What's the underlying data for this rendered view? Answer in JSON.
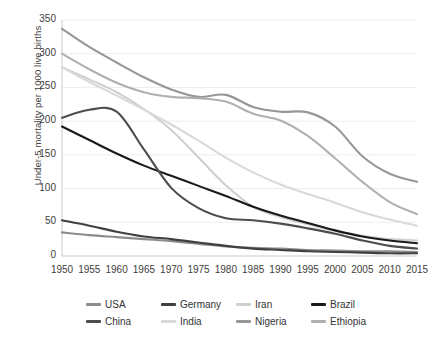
{
  "chart_data": {
    "type": "line",
    "title": "",
    "xlabel": "",
    "ylabel": "Under-5 mortality per 1000 live births",
    "x": [
      1950,
      1955,
      1960,
      1965,
      1970,
      1975,
      1980,
      1985,
      1990,
      1995,
      2000,
      2005,
      2010,
      2015
    ],
    "xlim": [
      1950,
      2015
    ],
    "ylim": [
      0,
      350
    ],
    "yticks": [
      0,
      50,
      100,
      150,
      200,
      250,
      300,
      350
    ],
    "xticks": [
      "1950",
      "1955",
      "1960",
      "1965",
      "1970",
      "1975",
      "1980",
      "1985",
      "1990",
      "1995",
      "2000",
      "2005",
      "2010",
      "2015"
    ],
    "grid": "horizontal",
    "legend_position": "bottom",
    "series": [
      {
        "name": "USA",
        "color": "#8c8c8c",
        "values": [
          35,
          31,
          28,
          25,
          22,
          18,
          14,
          12,
          11,
          9,
          8,
          7,
          7,
          6
        ]
      },
      {
        "name": "Germany",
        "color": "#404040",
        "values": [
          53,
          45,
          36,
          29,
          25,
          20,
          15,
          11,
          9,
          7,
          6,
          5,
          4,
          4
        ]
      },
      {
        "name": "Iran",
        "color": "#cfcfcf",
        "values": [
          280,
          262,
          243,
          218,
          187,
          146,
          105,
          73,
          58,
          47,
          37,
          30,
          25,
          23
        ]
      },
      {
        "name": "Brazil",
        "color": "#1a1a1a",
        "values": [
          192,
          172,
          152,
          134,
          119,
          104,
          89,
          73,
          60,
          49,
          38,
          29,
          23,
          19
        ]
      },
      {
        "name": "China",
        "color": "#4d4d4d",
        "values": [
          205,
          217,
          214,
          158,
          101,
          71,
          56,
          53,
          48,
          41,
          33,
          23,
          15,
          11
        ]
      },
      {
        "name": "India",
        "color": "#d9d9d9",
        "values": [
          280,
          258,
          238,
          217,
          195,
          171,
          146,
          124,
          106,
          92,
          79,
          65,
          54,
          45
        ]
      },
      {
        "name": "Nigeria",
        "color": "#979797",
        "values": [
          337,
          310,
          287,
          265,
          247,
          236,
          239,
          221,
          214,
          213,
          192,
          148,
          122,
          110
        ]
      },
      {
        "name": "Ethiopia",
        "color": "#b0b0b0",
        "values": [
          300,
          277,
          257,
          243,
          236,
          234,
          229,
          211,
          201,
          178,
          145,
          110,
          80,
          62
        ]
      }
    ]
  },
  "axes": {
    "y_title": "Under-5 mortality per 1000 live births",
    "y_labels": [
      "350",
      "300",
      "250",
      "200",
      "150",
      "100",
      "50",
      "0"
    ],
    "x_labels": [
      "1950",
      "1955",
      "1960",
      "1965",
      "1970",
      "1975",
      "1980",
      "1985",
      "1990",
      "1995",
      "2000",
      "2005",
      "2010",
      "2015"
    ]
  },
  "legend": {
    "items": [
      {
        "label": "USA",
        "color": "#8c8c8c"
      },
      {
        "label": "Germany",
        "color": "#404040"
      },
      {
        "label": "Iran",
        "color": "#cfcfcf"
      },
      {
        "label": "Brazil",
        "color": "#1a1a1a"
      },
      {
        "label": "China",
        "color": "#4d4d4d"
      },
      {
        "label": "India",
        "color": "#d9d9d9"
      },
      {
        "label": "Nigeria",
        "color": "#979797"
      },
      {
        "label": "Ethiopia",
        "color": "#b0b0b0"
      }
    ]
  }
}
